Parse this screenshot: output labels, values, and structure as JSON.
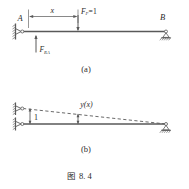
{
  "figure": {
    "caption_prefix": "图",
    "caption_number": "8. 4",
    "caption_full": "图 8. 4"
  },
  "panel_a": {
    "sublabel": "(a)",
    "node_a_label": "A",
    "node_b_label": "B",
    "dimension_label": "x",
    "load_label_base": "F",
    "load_label_sub": "P",
    "load_label_eq": "=1",
    "reaction_label_base": "F",
    "reaction_label_sub": "RA",
    "support_a_type": "pin-wall",
    "support_b_type": "roller-ground",
    "load_direction": "downward",
    "reaction_direction": "upward"
  },
  "panel_b": {
    "sublabel": "(b)",
    "unit_displacement_label": "1",
    "deflection_label": "y(x)",
    "support_upper_type": "pin-wall",
    "support_lower_type": "pin-wall",
    "support_right_type": "roller-ground",
    "deflection_curve_style": "dashed",
    "ordinate_direction": "upward"
  },
  "colors": {
    "line": "#595959",
    "thin_line": "#6b6b6b",
    "text": "#2b2b2b",
    "background": "#ffffff"
  }
}
